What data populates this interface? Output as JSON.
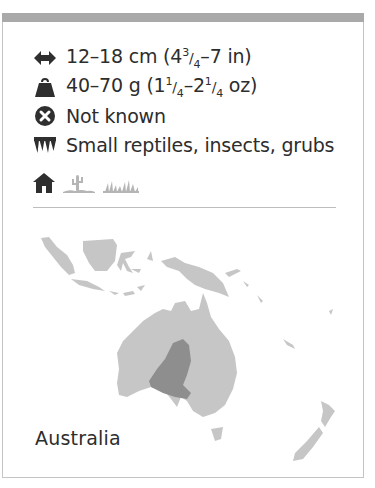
{
  "facts": {
    "size": {
      "icon": "length-arrows-icon",
      "text": "12–18 cm (4¾–7 in)",
      "main": "12–18 cm (4",
      "frac_num": "3",
      "frac_den": "4",
      "tail": "–7 in)"
    },
    "weight": {
      "icon": "weight-icon",
      "text": "40–70 g (1¼–2¼ oz)",
      "main": "40–70 g (1",
      "frac1_num": "1",
      "frac1_den": "4",
      "mid": "–2",
      "frac2_num": "1",
      "frac2_den": "4",
      "tail": " oz)"
    },
    "status": {
      "icon": "cross-circle-icon",
      "text": "Not known"
    },
    "diet": {
      "icon": "teeth-icon",
      "text": "Small reptiles, insects, grubs"
    },
    "habitat": {
      "icons": [
        "burrow-home-icon",
        "desert-cactus-icon",
        "grassland-icon"
      ]
    }
  },
  "map": {
    "region_label": "Australia",
    "colors": {
      "land": "#c6c6c6",
      "range": "#8e8e8e"
    }
  },
  "colors": {
    "top_bar": "#a9a9a9",
    "border": "#c4c4c4",
    "text": "#2d2d2d",
    "icon_dark": "#2f2f2f",
    "icon_light": "#b5b5b5"
  }
}
